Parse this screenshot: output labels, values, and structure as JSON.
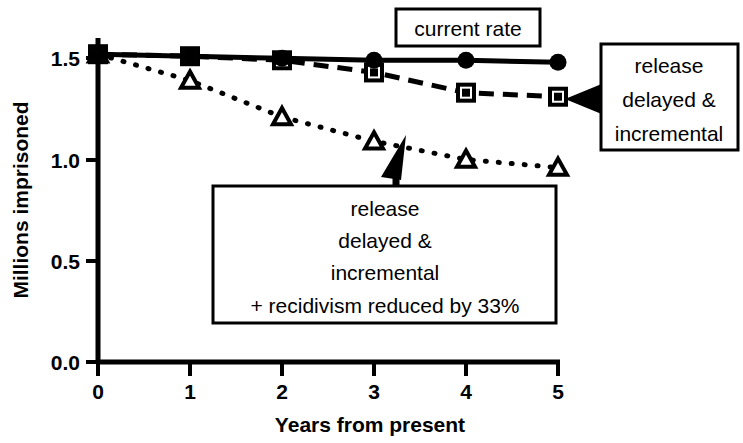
{
  "chart_data": {
    "type": "line",
    "title": "",
    "xlabel": "Years from present",
    "ylabel": "Millions imprisoned",
    "x": [
      0,
      1,
      2,
      3,
      4,
      5
    ],
    "xticklabels": [
      "0",
      "1",
      "2",
      "3",
      "4",
      "5"
    ],
    "yticklabels": [
      "0.0",
      "0.5",
      "1.0",
      "1.5"
    ],
    "yticks": [
      0.0,
      0.5,
      1.0,
      1.5
    ],
    "xlim": [
      0,
      5
    ],
    "ylim": [
      0.0,
      1.6
    ],
    "grid": false,
    "legend": "annotation-boxes",
    "series": [
      {
        "name": "current rate",
        "marker": "filled-circle",
        "linestyle": "solid",
        "values": [
          1.52,
          1.51,
          1.5,
          1.49,
          1.49,
          1.48
        ]
      },
      {
        "name": "release delayed & incremental",
        "marker": "open-square",
        "linestyle": "dashed",
        "values": [
          1.52,
          1.51,
          1.49,
          1.43,
          1.33,
          1.31
        ]
      },
      {
        "name": "release delayed & incremental + recidivism reduced by 33%",
        "marker": "open-triangle",
        "linestyle": "dotted",
        "values": [
          1.52,
          1.39,
          1.21,
          1.09,
          1.0,
          0.96
        ]
      }
    ],
    "annotations": [
      {
        "id": "current-rate",
        "lines": [
          "current rate"
        ],
        "boxed": true,
        "arrow": false
      },
      {
        "id": "release-delayed-incremental",
        "lines": [
          "release",
          "delayed &",
          "incremental"
        ],
        "boxed": true,
        "arrow": true,
        "arrow_direction": "left"
      },
      {
        "id": "recidivism-reduced",
        "lines": [
          "release",
          "delayed &",
          "incremental",
          "+ recidivism reduced by 33%"
        ],
        "boxed": true,
        "arrow": true,
        "arrow_direction": "up"
      }
    ],
    "colors": {
      "line": "#000000",
      "background": "#ffffff",
      "text": "#000000"
    }
  }
}
